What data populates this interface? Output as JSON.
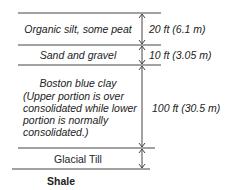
{
  "diagram": {
    "layers": [
      {
        "name": "Organic silt, some peat",
        "thickness": "20 ft (6.1 m)"
      },
      {
        "name": "Sand and gravel",
        "thickness": "10 ft (3.05 m)"
      },
      {
        "name": "Boston blue clay",
        "note_lines": [
          "(Upper portion is over",
          "consolidated while lower",
          "portion is normally",
          "consolidated.)"
        ],
        "thickness": "100 ft (30.5 m)"
      },
      {
        "name": "Glacial Till",
        "thickness": ""
      }
    ],
    "base": "Shale"
  }
}
